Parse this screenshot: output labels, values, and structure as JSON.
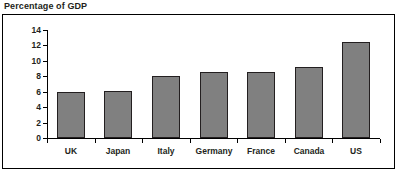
{
  "chart_data": {
    "type": "bar",
    "title": "Percentage of GDP",
    "xlabel": "",
    "ylabel": "",
    "categories": [
      "UK",
      "Japan",
      "Italy",
      "Germany",
      "France",
      "Canada",
      "US"
    ],
    "values": [
      6.0,
      6.1,
      8.0,
      8.6,
      8.6,
      9.2,
      12.4
    ],
    "ylim": [
      0,
      14
    ],
    "yticks": [
      0,
      2,
      4,
      6,
      8,
      10,
      12,
      14
    ],
    "ytick_labels": [
      "0",
      "2",
      "4",
      "6",
      "8",
      "10",
      "12",
      "14"
    ],
    "grid": false,
    "legend": false,
    "bar_color": "#808080",
    "bar_edge_color": "#231f20",
    "axis_color": "#000000",
    "text_color": "#231f20",
    "background": "#ffffff"
  }
}
